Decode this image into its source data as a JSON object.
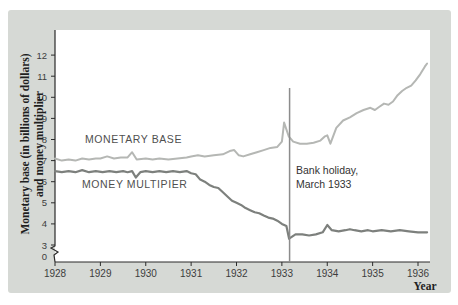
{
  "figure": {
    "background_color": "#d6d9d5",
    "plot_background": "#ffffff",
    "axis_color": "#2b2b2b",
    "tick_text_color": "#3d3d3d"
  },
  "labels": {
    "y_axis_title_line1": "Monetary base (in billions of dollars)",
    "y_axis_title_line2": "and money multiplier",
    "x_axis_title": "Year",
    "monetary_base": "MONETARY BASE",
    "money_multiplier": "MONEY MULTIPIER",
    "annotation_line1": "Bank holiday,",
    "annotation_line2": "March 1933"
  },
  "chart_data": {
    "type": "line",
    "title": "",
    "xlabel": "Year",
    "ylabel": "Monetary base (in billions of dollars) and money multiplier",
    "x_ticks": [
      1928,
      1929,
      1930,
      1931,
      1932,
      1933,
      1934,
      1935,
      1936
    ],
    "y_ticks": [
      3,
      4,
      5,
      6,
      7,
      8,
      9,
      10,
      11,
      12
    ],
    "y_zero_label": "0",
    "axis_break_between_0_and_3": true,
    "xlim": [
      1928,
      1936.25
    ],
    "ylim": [
      3,
      12
    ],
    "legend_position": "inline-labels",
    "grid": false,
    "annotation": {
      "text": "Bank holiday, March 1933",
      "x": 1933.17,
      "line_top_value": 10.44,
      "line_color": "#8c8c8c"
    },
    "series": [
      {
        "name": "MONETARY BASE",
        "color": "#b5b7b4",
        "width": 2,
        "points": [
          [
            1928.0,
            7.1
          ],
          [
            1928.15,
            7.0
          ],
          [
            1928.3,
            7.05
          ],
          [
            1928.45,
            7.0
          ],
          [
            1928.6,
            7.1
          ],
          [
            1928.75,
            7.05
          ],
          [
            1928.9,
            7.1
          ],
          [
            1929.0,
            7.1
          ],
          [
            1929.15,
            7.2
          ],
          [
            1929.3,
            7.1
          ],
          [
            1929.45,
            7.15
          ],
          [
            1929.6,
            7.15
          ],
          [
            1929.7,
            7.4
          ],
          [
            1929.8,
            7.05
          ],
          [
            1930.0,
            7.1
          ],
          [
            1930.15,
            7.05
          ],
          [
            1930.3,
            7.1
          ],
          [
            1930.5,
            7.05
          ],
          [
            1930.7,
            7.1
          ],
          [
            1930.9,
            7.15
          ],
          [
            1931.0,
            7.2
          ],
          [
            1931.15,
            7.25
          ],
          [
            1931.3,
            7.2
          ],
          [
            1931.5,
            7.25
          ],
          [
            1931.7,
            7.3
          ],
          [
            1931.85,
            7.45
          ],
          [
            1931.95,
            7.5
          ],
          [
            1932.05,
            7.25
          ],
          [
            1932.15,
            7.2
          ],
          [
            1932.3,
            7.3
          ],
          [
            1932.45,
            7.4
          ],
          [
            1932.6,
            7.5
          ],
          [
            1932.75,
            7.6
          ],
          [
            1932.9,
            7.65
          ],
          [
            1933.0,
            7.9
          ],
          [
            1933.05,
            8.8
          ],
          [
            1933.15,
            8.15
          ],
          [
            1933.25,
            7.9
          ],
          [
            1933.4,
            7.8
          ],
          [
            1933.55,
            7.8
          ],
          [
            1933.7,
            7.85
          ],
          [
            1933.85,
            7.95
          ],
          [
            1933.95,
            8.15
          ],
          [
            1934.0,
            8.2
          ],
          [
            1934.07,
            7.8
          ],
          [
            1934.2,
            8.55
          ],
          [
            1934.35,
            8.9
          ],
          [
            1934.5,
            9.05
          ],
          [
            1934.65,
            9.25
          ],
          [
            1934.8,
            9.4
          ],
          [
            1934.95,
            9.5
          ],
          [
            1935.05,
            9.4
          ],
          [
            1935.15,
            9.55
          ],
          [
            1935.25,
            9.7
          ],
          [
            1935.35,
            9.65
          ],
          [
            1935.45,
            9.8
          ],
          [
            1935.55,
            10.1
          ],
          [
            1935.65,
            10.3
          ],
          [
            1935.75,
            10.45
          ],
          [
            1935.85,
            10.55
          ],
          [
            1935.95,
            10.8
          ],
          [
            1936.05,
            11.1
          ],
          [
            1936.15,
            11.45
          ],
          [
            1936.2,
            11.6
          ]
        ]
      },
      {
        "name": "MONEY MULTIPIER",
        "color": "#7d807d",
        "width": 2.2,
        "points": [
          [
            1928.0,
            6.5
          ],
          [
            1928.15,
            6.45
          ],
          [
            1928.3,
            6.5
          ],
          [
            1928.45,
            6.45
          ],
          [
            1928.6,
            6.55
          ],
          [
            1928.75,
            6.45
          ],
          [
            1928.9,
            6.5
          ],
          [
            1929.05,
            6.45
          ],
          [
            1929.2,
            6.5
          ],
          [
            1929.35,
            6.45
          ],
          [
            1929.5,
            6.5
          ],
          [
            1929.6,
            6.45
          ],
          [
            1929.7,
            6.5
          ],
          [
            1929.78,
            6.2
          ],
          [
            1929.88,
            6.45
          ],
          [
            1930.0,
            6.5
          ],
          [
            1930.15,
            6.45
          ],
          [
            1930.3,
            6.5
          ],
          [
            1930.45,
            6.45
          ],
          [
            1930.6,
            6.5
          ],
          [
            1930.75,
            6.45
          ],
          [
            1930.9,
            6.5
          ],
          [
            1931.0,
            6.4
          ],
          [
            1931.1,
            6.35
          ],
          [
            1931.2,
            6.1
          ],
          [
            1931.3,
            6.0
          ],
          [
            1931.4,
            5.85
          ],
          [
            1931.5,
            5.75
          ],
          [
            1931.6,
            5.7
          ],
          [
            1931.7,
            5.5
          ],
          [
            1931.8,
            5.3
          ],
          [
            1931.9,
            5.1
          ],
          [
            1932.0,
            5.0
          ],
          [
            1932.1,
            4.9
          ],
          [
            1932.2,
            4.75
          ],
          [
            1932.3,
            4.65
          ],
          [
            1932.4,
            4.55
          ],
          [
            1932.5,
            4.5
          ],
          [
            1932.6,
            4.4
          ],
          [
            1932.7,
            4.3
          ],
          [
            1932.8,
            4.25
          ],
          [
            1932.9,
            4.15
          ],
          [
            1933.0,
            4.0
          ],
          [
            1933.1,
            3.9
          ],
          [
            1933.16,
            3.3
          ],
          [
            1933.3,
            3.5
          ],
          [
            1933.45,
            3.5
          ],
          [
            1933.6,
            3.45
          ],
          [
            1933.75,
            3.5
          ],
          [
            1933.9,
            3.6
          ],
          [
            1934.0,
            3.95
          ],
          [
            1934.1,
            3.7
          ],
          [
            1934.25,
            3.65
          ],
          [
            1934.4,
            3.7
          ],
          [
            1934.5,
            3.75
          ],
          [
            1934.6,
            3.7
          ],
          [
            1934.75,
            3.65
          ],
          [
            1934.9,
            3.7
          ],
          [
            1935.0,
            3.65
          ],
          [
            1935.2,
            3.7
          ],
          [
            1935.4,
            3.65
          ],
          [
            1935.6,
            3.7
          ],
          [
            1935.8,
            3.65
          ],
          [
            1936.0,
            3.6
          ],
          [
            1936.2,
            3.6
          ]
        ]
      }
    ]
  }
}
